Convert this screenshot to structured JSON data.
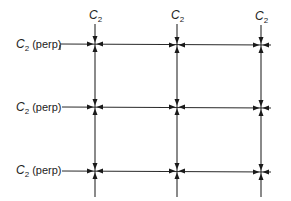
{
  "diagram": {
    "type": "lattice-symmetry-grid",
    "column_labels": [
      {
        "base": "C",
        "sub": "2"
      },
      {
        "base": "C",
        "sub": "2"
      },
      {
        "base": "C",
        "sub": "2"
      }
    ],
    "row_labels": [
      {
        "base": "C",
        "sub": "2",
        "suffix": " (perp)"
      },
      {
        "base": "C",
        "sub": "2",
        "suffix": " (perp)"
      },
      {
        "base": "C",
        "sub": "2",
        "suffix": " (perp)"
      }
    ],
    "columns_x": [
      95,
      177,
      261
    ],
    "rows_y": [
      44,
      107,
      171
    ],
    "nodes": 9,
    "node_marker": "four-inward-arrowheads",
    "colors": {
      "line": "#2a2a2a",
      "arrow": "#1a1a1a",
      "background": "#ffffff"
    }
  }
}
